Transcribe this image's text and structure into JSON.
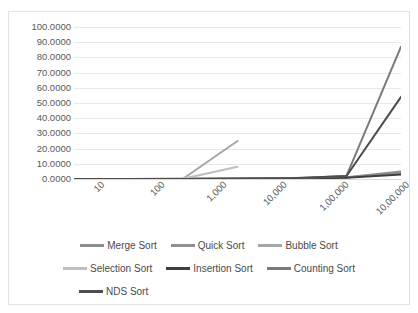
{
  "chart_data": {
    "type": "line",
    "title": "",
    "xlabel": "",
    "ylabel": "",
    "grid": true,
    "legend_position": "bottom",
    "categories": [
      "10",
      "100",
      "1,000",
      "10,000",
      "1,00,000",
      "10,00,000",
      "1,00,00,000"
    ],
    "ylim": [
      0,
      100
    ],
    "yticks": [
      "0.0000",
      "10.0000",
      "20.0000",
      "30.0000",
      "40.0000",
      "50.0000",
      "60.0000",
      "70.0000",
      "80.0000",
      "90.0000",
      "100.0000"
    ],
    "ytick_values": [
      0,
      10,
      20,
      30,
      40,
      50,
      60,
      70,
      80,
      90,
      100
    ],
    "series": [
      {
        "name": "Merge Sort",
        "color": "#8c8c8c",
        "values": [
          0,
          0,
          0.1,
          0.3,
          0.6,
          1.2,
          5.0
        ]
      },
      {
        "name": "Quick Sort",
        "color": "#8f8f8f",
        "values": [
          0,
          0,
          0.1,
          0.2,
          0.5,
          1.0,
          4.0
        ]
      },
      {
        "name": "Bubble Sort",
        "color": "#a6a6a6",
        "values": [
          0,
          0,
          0.2,
          25.0,
          0,
          0,
          0
        ]
      },
      {
        "name": "Selection Sort",
        "color": "#bfbfbf",
        "values": [
          0,
          0,
          0.1,
          8.0,
          0,
          0,
          0
        ]
      },
      {
        "name": "Insertion Sort",
        "color": "#3f3f3f",
        "values": [
          0,
          0,
          0,
          0.1,
          0.3,
          0.8,
          3.0
        ]
      },
      {
        "name": "Counting Sort",
        "color": "#7a7a7a",
        "values": [
          0,
          0,
          0,
          0.1,
          0.4,
          2.0,
          87.0
        ]
      },
      {
        "name": "NDS Sort",
        "color": "#4d4d4d",
        "values": [
          0,
          0,
          0,
          0.1,
          0.5,
          2.0,
          54.0
        ]
      }
    ]
  }
}
